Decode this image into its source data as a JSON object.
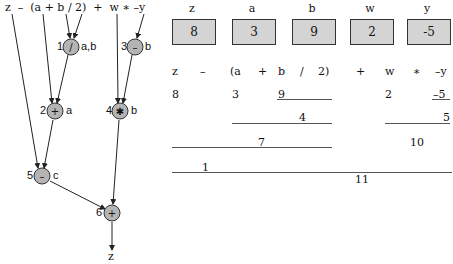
{
  "expression": "z  –  (a + b / 2)  +  w ∗ –y",
  "tree": {
    "nodes": [
      {
        "id": "1",
        "op": "/",
        "reg": "a,b"
      },
      {
        "id": "2",
        "op": "+",
        "reg": "a"
      },
      {
        "id": "3",
        "op": "–",
        "reg": "b"
      },
      {
        "id": "4",
        "op": "∗",
        "reg": "b"
      },
      {
        "id": "5",
        "op": "–",
        "reg": "c"
      },
      {
        "id": "6",
        "op": "+",
        "reg": ""
      }
    ],
    "result": "z"
  },
  "variables": [
    {
      "name": "z",
      "value": "8"
    },
    {
      "name": "a",
      "value": "3"
    },
    {
      "name": "b",
      "value": "9"
    },
    {
      "name": "w",
      "value": "2"
    },
    {
      "name": "y",
      "value": "-5"
    }
  ],
  "evaluation": {
    "tokens": [
      "z",
      "–",
      "(a",
      "+",
      "b",
      "/",
      "2)",
      "+",
      "w",
      "∗",
      "–y"
    ],
    "row1": {
      "z": "8",
      "a": "3",
      "b": "9",
      "w": "2",
      "neg_y": "–5"
    },
    "row2": {
      "div": "4",
      "neg": "5"
    },
    "row3": {
      "add": "7",
      "mul": "10"
    },
    "row4": {
      "sub": "1"
    },
    "row5": {
      "final": "11"
    }
  },
  "colors": {
    "node_fill": "#b4b4b4",
    "box_fill": "#d4d4d4",
    "line": "#222222"
  }
}
